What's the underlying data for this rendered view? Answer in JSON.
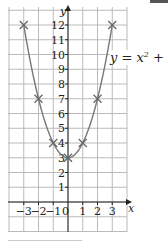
{
  "chart_data": {
    "type": "line",
    "title": "",
    "equation": "y = x² + 3",
    "xlabel": "x",
    "ylabel": "y",
    "x": [
      -3,
      -2,
      -1,
      0,
      1,
      2,
      3
    ],
    "series": [
      {
        "name": "y = x^2 + 3",
        "values": [
          12,
          7,
          4,
          3,
          4,
          7,
          12
        ]
      }
    ],
    "xlim": [
      -4,
      4
    ],
    "ylim": [
      -2,
      13
    ],
    "x_ticks": [
      "-3",
      "-2",
      "-1",
      "0",
      "1",
      "2",
      "3"
    ],
    "y_ticks": [
      "1",
      "2",
      "3",
      "4",
      "5",
      "6",
      "7",
      "8",
      "9",
      "10",
      "11",
      "12"
    ],
    "grid": true,
    "marker": "x",
    "line_color": "#777777",
    "grid_color": "#bbbbbb"
  },
  "labels": {
    "equation_text": "y = x",
    "equation_exp": "2",
    "equation_tail": " + 3"
  }
}
